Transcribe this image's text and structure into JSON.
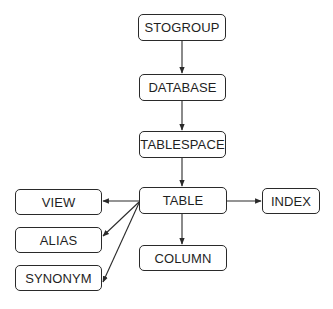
{
  "diagram": {
    "type": "hierarchy",
    "nodes": [
      {
        "id": "stogroup",
        "label": "STOGROUP",
        "x": 138,
        "y": 14,
        "w": 88,
        "h": 27
      },
      {
        "id": "database",
        "label": "DATABASE",
        "x": 139,
        "y": 74,
        "w": 87,
        "h": 27
      },
      {
        "id": "tablespace",
        "label": "TABLESPACE",
        "x": 139,
        "y": 131,
        "w": 87,
        "h": 27
      },
      {
        "id": "table",
        "label": "TABLE",
        "x": 139,
        "y": 187,
        "w": 88,
        "h": 27
      },
      {
        "id": "index",
        "label": "INDEX",
        "x": 262,
        "y": 188,
        "w": 58,
        "h": 26
      },
      {
        "id": "view",
        "label": "VIEW",
        "x": 15,
        "y": 189,
        "w": 87,
        "h": 26
      },
      {
        "id": "alias",
        "label": "ALIAS",
        "x": 15,
        "y": 227,
        "w": 87,
        "h": 26
      },
      {
        "id": "synonym",
        "label": "SYNONYM",
        "x": 15,
        "y": 265,
        "w": 87,
        "h": 26
      },
      {
        "id": "column",
        "label": "COLUMN",
        "x": 139,
        "y": 245,
        "w": 88,
        "h": 26
      }
    ],
    "edges": [
      {
        "from": "stogroup",
        "to": "database"
      },
      {
        "from": "database",
        "to": "tablespace"
      },
      {
        "from": "tablespace",
        "to": "table"
      },
      {
        "from": "table",
        "to": "index"
      },
      {
        "from": "table",
        "to": "view"
      },
      {
        "from": "table",
        "to": "alias"
      },
      {
        "from": "table",
        "to": "synonym"
      },
      {
        "from": "table",
        "to": "column"
      }
    ]
  },
  "colors": {
    "stroke": "#2a2a2a",
    "text": "#1f1f1f",
    "background": "#ffffff"
  }
}
